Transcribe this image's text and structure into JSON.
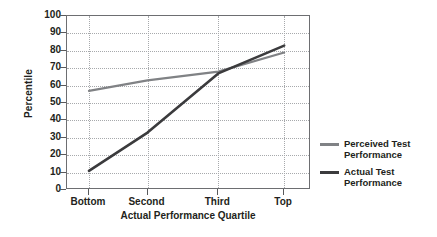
{
  "chart_data": {
    "type": "line",
    "title": "",
    "xlabel": "Actual Performance Quartile",
    "ylabel": "Percentile",
    "categories": [
      "Bottom",
      "Second",
      "Third",
      "Top"
    ],
    "ylim": [
      0,
      100
    ],
    "yticks": [
      0,
      10,
      20,
      30,
      40,
      50,
      60,
      70,
      80,
      90,
      100
    ],
    "grid": "dotted-both",
    "legend_position": "right",
    "series": [
      {
        "name": "Perceived Test Performance",
        "values": [
          57,
          63,
          68,
          79
        ],
        "color": "#808285"
      },
      {
        "name": "Actual Test Performance",
        "values": [
          11,
          33,
          67,
          83
        ],
        "color": "#3b3b3d"
      }
    ]
  },
  "axis": {
    "y_title": "Percentile",
    "x_title": "Actual Performance Quartile",
    "y_tick_labels": [
      "100",
      "90",
      "80",
      "70",
      "60",
      "50",
      "40",
      "30",
      "20",
      "10",
      "0"
    ],
    "x_tick_labels": [
      "Bottom",
      "Second",
      "Third",
      "Top"
    ]
  },
  "legend": {
    "items": [
      {
        "label_line1": "Perceived Test",
        "label_line2": "Performance",
        "color": "#808285"
      },
      {
        "label_line1": "Actual Test",
        "label_line2": "Performance",
        "color": "#3b3b3d"
      }
    ]
  },
  "colors": {
    "perceived": "#808285",
    "actual": "#3b3b3d",
    "axis": "#6d6e71",
    "grid": "#a7a9ac",
    "text": "#231f20",
    "background": "#ffffff"
  }
}
